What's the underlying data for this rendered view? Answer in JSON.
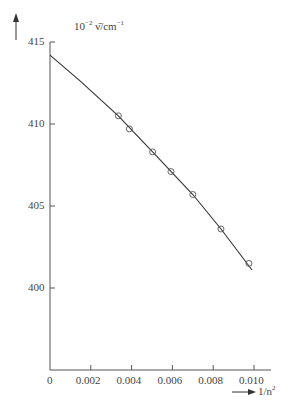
{
  "chart_data": {
    "type": "scatter",
    "title": "",
    "ylabel": "10^-2 ν̄/cm^-1",
    "ylabel_text": "10",
    "ylabel_sup": "−2",
    "ylabel_rest": " ν̄/cm",
    "ylabel_sup2": "−1",
    "xlabel": "1/n²",
    "xlabel_text": "1/n",
    "xlabel_sup": "2",
    "xlim": [
      0,
      0.0105
    ],
    "ylim": [
      395.5,
      415
    ],
    "xticks": [
      "0",
      "0.002",
      "0.004",
      "0.006",
      "0.008",
      "0.010"
    ],
    "xtick_values": [
      0,
      0.002,
      0.004,
      0.006,
      0.008,
      0.01
    ],
    "yticks": [
      "415",
      "410",
      "405",
      "400"
    ],
    "ytick_values": [
      415,
      410,
      405,
      400
    ],
    "grid": false,
    "series": [
      {
        "name": "measured",
        "marker": "open-circle",
        "x": [
          0.00335,
          0.00389,
          0.00503,
          0.00593,
          0.007,
          0.00838,
          0.00975
        ],
        "y": [
          410.5,
          409.7,
          408.3,
          407.1,
          405.7,
          403.6,
          401.5
        ]
      },
      {
        "name": "fit-curve",
        "marker": "line",
        "x": [
          0,
          0.0015,
          0.00335,
          0.00503,
          0.007,
          0.00838,
          0.0099
        ],
        "y": [
          414.2,
          412.6,
          410.5,
          408.3,
          405.7,
          403.6,
          401.1
        ]
      }
    ]
  }
}
